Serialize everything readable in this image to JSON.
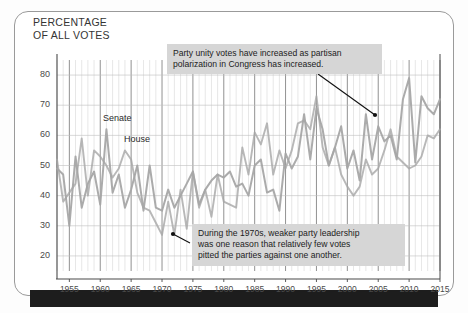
{
  "figure": {
    "title": "PERCENTAGE\nOF ALL VOTES",
    "frame_color": "#9a9a9a",
    "background": "#ffffff"
  },
  "annotations": [
    {
      "id": "annotation-polarization",
      "text": "Party unity votes have increased as partisan\npolarization in Congress has increased.",
      "box": {
        "x": 167,
        "y": 44,
        "w": 215,
        "h": 26
      },
      "arrow": {
        "x1": 318,
        "y1": 74,
        "x2": 375,
        "y2": 115
      }
    },
    {
      "id": "annotation-1970s",
      "text": "During the 1970s, weaker party leadership\nwas one reason that relatively few votes\npitted the parties against one another.",
      "box": {
        "x": 192,
        "y": 224,
        "w": 213,
        "h": 38
      },
      "arrow": {
        "x1": 190,
        "y1": 243,
        "x2": 173,
        "y2": 234
      }
    }
  ],
  "series_labels": [
    {
      "name": "Senate",
      "x": 103,
      "y": 113
    },
    {
      "name": "House",
      "x": 124,
      "y": 134
    }
  ],
  "chart_data": {
    "type": "line",
    "title": "PERCENTAGE OF ALL VOTES",
    "subtitle": "Party unity votes in Congress",
    "xlabel": "",
    "ylabel": "PERCENTAGE OF ALL VOTES",
    "xlim": [
      1953,
      2015
    ],
    "ylim": [
      15,
      85
    ],
    "xticks": [
      1955,
      1960,
      1965,
      1970,
      1975,
      1980,
      1985,
      1990,
      1995,
      2000,
      2005,
      2010,
      2015
    ],
    "yticks": [
      20,
      30,
      40,
      50,
      60,
      70,
      80
    ],
    "grid": "both-axes minor yearly vertical lines, major 5-year lines darker",
    "legend": "inline labels on lines",
    "line_color": "#a6a6a6",
    "x": [
      1953,
      1954,
      1955,
      1956,
      1957,
      1958,
      1959,
      1960,
      1961,
      1962,
      1963,
      1964,
      1965,
      1966,
      1967,
      1968,
      1969,
      1970,
      1971,
      1972,
      1973,
      1974,
      1975,
      1976,
      1977,
      1978,
      1979,
      1980,
      1981,
      1982,
      1983,
      1984,
      1985,
      1986,
      1987,
      1988,
      1989,
      1990,
      1991,
      1992,
      1993,
      1994,
      1995,
      1996,
      1997,
      1998,
      1999,
      2000,
      2001,
      2002,
      2003,
      2004,
      2005,
      2006,
      2007,
      2008,
      2009,
      2010,
      2011,
      2012,
      2013,
      2014,
      2015
    ],
    "series": [
      {
        "name": "Senate",
        "values": [
          49,
          47,
          30,
          53,
          36,
          44,
          48,
          37,
          62,
          41,
          47,
          36,
          42,
          50,
          35,
          50,
          36,
          35,
          42,
          36,
          40,
          44,
          48,
          37,
          42,
          45,
          47,
          46,
          48,
          43,
          44,
          40,
          50,
          52,
          41,
          42,
          35,
          54,
          49,
          53,
          67,
          52,
          69,
          62,
          50,
          56,
          63,
          49,
          55,
          45,
          67,
          52,
          63,
          58,
          60,
          52,
          72,
          79,
          51,
          73,
          69,
          67,
          72
        ]
      },
      {
        "name": "House",
        "values": [
          52,
          38,
          41,
          44,
          59,
          40,
          55,
          53,
          50,
          46,
          49,
          55,
          52,
          41,
          36,
          35,
          31,
          27,
          38,
          27,
          42,
          29,
          48,
          36,
          42,
          33,
          47,
          38,
          37,
          36,
          56,
          47,
          61,
          57,
          64,
          47,
          55,
          49,
          55,
          64,
          65,
          62,
          73,
          56,
          50,
          56,
          47,
          43,
          40,
          43,
          52,
          47,
          49,
          55,
          62,
          53,
          51,
          49,
          50,
          53,
          60,
          59,
          62
        ]
      }
    ]
  }
}
